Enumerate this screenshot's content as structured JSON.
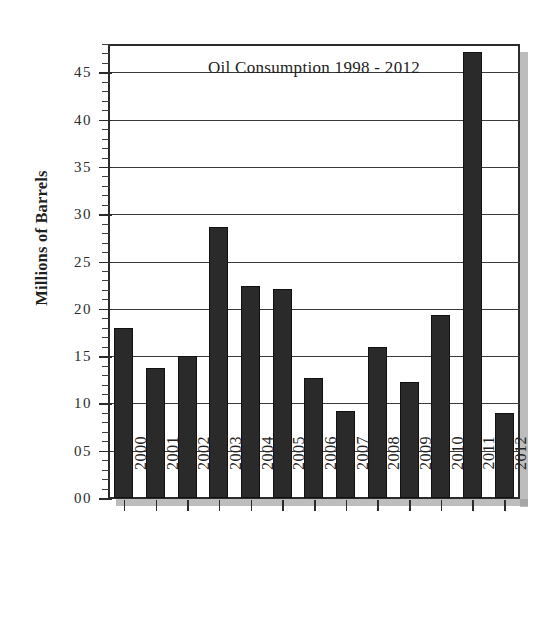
{
  "chart_data": {
    "type": "bar",
    "title": "Oil Consumption 1998 - 2012",
    "xlabel": "",
    "ylabel": "Millions of Barrels",
    "ylim": [
      0,
      48
    ],
    "ytick_values": [
      0,
      5,
      10,
      15,
      20,
      25,
      30,
      35,
      40,
      45
    ],
    "ytick_labels": [
      "00",
      "05",
      "10",
      "15",
      "20",
      "25",
      "30",
      "35",
      "40",
      "45"
    ],
    "minor_tick_step": 1,
    "grid": true,
    "grid_axis": "y",
    "legend": null,
    "bar_color": "#2a2a2a",
    "categories": [
      "2000",
      "2001",
      "2002",
      "2003",
      "2004",
      "2005",
      "2006",
      "2007",
      "2008",
      "2009",
      "2010",
      "2011",
      "2012"
    ],
    "values": [
      18.0,
      13.7,
      15.0,
      28.7,
      22.4,
      22.1,
      12.7,
      9.2,
      16.0,
      12.3,
      19.4,
      47.2,
      9.0
    ],
    "xtick_label_rotation": -90
  },
  "axis": {
    "y_title": "Millions of Barrels"
  }
}
